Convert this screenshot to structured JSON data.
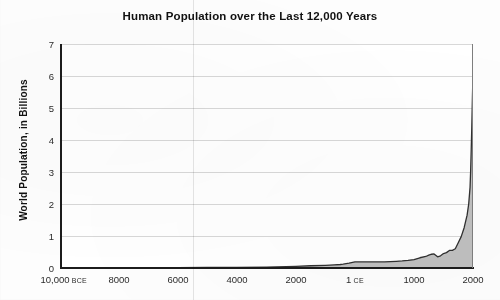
{
  "chart_data": {
    "type": "area",
    "title": "Human Population over the Last 12,000 Years",
    "xlabel": "",
    "ylabel": "World Population, in Billions",
    "ylim": [
      0,
      7
    ],
    "xlim": [
      -10000,
      2000
    ],
    "grid": true,
    "legend": null,
    "y_ticks": [
      {
        "value": 0,
        "label": "0"
      },
      {
        "value": 1,
        "label": "1"
      },
      {
        "value": 2,
        "label": "2"
      },
      {
        "value": 3,
        "label": "3"
      },
      {
        "value": 4,
        "label": "4"
      },
      {
        "value": 5,
        "label": "5"
      },
      {
        "value": 6,
        "label": "6"
      },
      {
        "value": 7,
        "label": "7"
      }
    ],
    "x_ticks": [
      {
        "value": -10000,
        "label": "10,000",
        "era": "BCE"
      },
      {
        "value": -8000,
        "label": "8000",
        "era": ""
      },
      {
        "value": -6000,
        "label": "6000",
        "era": ""
      },
      {
        "value": -4000,
        "label": "4000",
        "era": ""
      },
      {
        "value": -2000,
        "label": "2000",
        "era": ""
      },
      {
        "value": 1,
        "label": "1",
        "era": "CE"
      },
      {
        "value": 1000,
        "label": "1000",
        "era": ""
      },
      {
        "value": 2000,
        "label": "2000",
        "era": ""
      }
    ],
    "series": [
      {
        "name": "World Population",
        "line_color": "#303030",
        "fill_color": "#bdbdbd",
        "x": [
          -10000,
          -9000,
          -8000,
          -7000,
          -6000,
          -5000,
          -4000,
          -3000,
          -2000,
          -1500,
          -1000,
          -700,
          -500,
          -400,
          -200,
          1,
          200,
          400,
          500,
          600,
          700,
          800,
          900,
          1000,
          1100,
          1200,
          1250,
          1300,
          1340,
          1400,
          1450,
          1500,
          1550,
          1600,
          1650,
          1700,
          1750,
          1800,
          1850,
          1900,
          1927,
          1950,
          1960,
          1970,
          1980,
          1990,
          1999,
          2000
        ],
        "y": [
          0.004,
          0.005,
          0.005,
          0.007,
          0.01,
          0.015,
          0.02,
          0.03,
          0.05,
          0.07,
          0.085,
          0.1,
          0.11,
          0.12,
          0.15,
          0.19,
          0.19,
          0.19,
          0.19,
          0.2,
          0.21,
          0.22,
          0.24,
          0.265,
          0.32,
          0.36,
          0.4,
          0.43,
          0.44,
          0.35,
          0.38,
          0.45,
          0.48,
          0.55,
          0.55,
          0.6,
          0.79,
          0.98,
          1.26,
          1.65,
          2.0,
          2.52,
          3.03,
          3.7,
          4.44,
          5.31,
          6.0,
          6.12
        ]
      }
    ]
  }
}
